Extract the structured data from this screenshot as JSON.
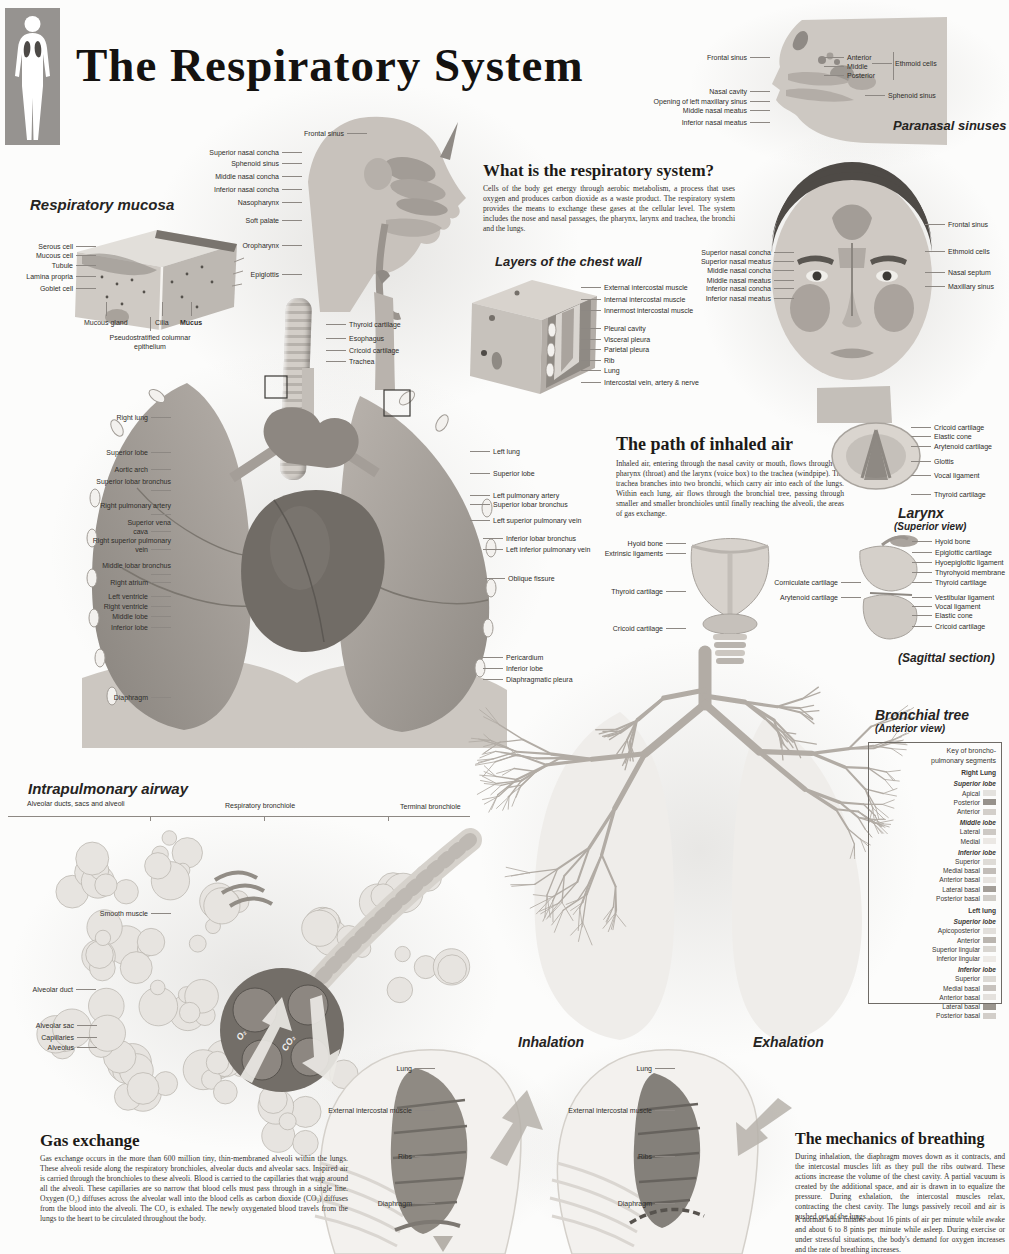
{
  "poster": {
    "title": "The Respiratory System"
  },
  "paranasal": {
    "title": "Paranasal sinuses",
    "labels_left": [
      "Frontal sinus",
      "Nasal cavity",
      "Opening of left maxillary sinus",
      "Middle nasal meatus",
      "Inferior nasal meatus"
    ],
    "ethmoid_items": [
      "Anterior",
      "Middle",
      "Posterior"
    ],
    "ethmoid_label": "Ethmoid cells",
    "sphenoid": "Sphenoid sinus"
  },
  "head_sagittal": {
    "labels": [
      "Frontal sinus",
      "Superior nasal concha",
      "Sphenoid sinus",
      "Middle nasal concha",
      "Inferior nasal concha",
      "Nasopharynx",
      "Soft palate",
      "Oropharynx",
      "Epiglottis"
    ],
    "trachea_labels": [
      "Thyroid cartilage",
      "Esophagus",
      "Cricoid cartilage",
      "Trachea"
    ]
  },
  "mucosa": {
    "title": "Respiratory mucosa",
    "labels_left": [
      "Serous cell",
      "Mucous cell",
      "Tubule",
      "Lamina propria",
      "Goblet cell"
    ],
    "labels_bottom": [
      "Mucous gland",
      "Cilia",
      "Mucus"
    ],
    "label_epithelium": "Pseudostratified columnar epithelium"
  },
  "what_is": {
    "heading": "What is the respiratory system?",
    "body": "Cells of the body get energy through aerobic metabolism, a process that uses oxygen and produces carbon dioxide as a waste product. The respiratory system provides the means to exchange these gases at the cellular level. The system includes the nose and nasal passages, the pharynx, larynx and trachea, the bronchi and the lungs."
  },
  "chest_wall": {
    "title": "Layers of the chest wall",
    "labels": [
      "External intercostal muscle",
      "Internal intercostal muscle",
      "Innermost intercostal muscle",
      "Pleural cavity",
      "Visceral pleura",
      "Parietal pleura",
      "Rib",
      "Lung",
      "Intercostal vein, artery & nerve"
    ]
  },
  "face": {
    "labels_left": [
      "Superior nasal concha",
      "Superior nasal meatus",
      "Middle nasal concha",
      "Middle nasal meatus",
      "Inferior nasal concha",
      "Inferior nasal meatus"
    ],
    "labels_right": [
      "Frontal sinus",
      "Ethmoid cells",
      "Nasal septum",
      "Maxillary sinus"
    ]
  },
  "lungs": {
    "labels_left": [
      "Right lung",
      "Superior lobe",
      "Aortic arch",
      "Superior lobar bronchus",
      "Right pulmonary artery",
      "Superior vena cava",
      "Right superior pulmonary vein",
      "Middle lobar bronchus",
      "Right atrium",
      "Left ventricle",
      "Right ventricle",
      "Middle lobe",
      "Inferior lobe",
      "Diaphragm"
    ],
    "labels_right": [
      "Left lung",
      "Superior lobe",
      "Left pulmonary artery",
      "Superior lobar bronchus",
      "Left superior pulmonary vein",
      "Inferior lobar bronchus",
      "Left inferior pulmonary vein",
      "Oblique fissure",
      "Pericardium",
      "Inferior lobe",
      "Diaphragmatic pleura"
    ]
  },
  "path_air": {
    "heading": "The path of inhaled air",
    "body": "Inhaled air, entering through the nasal cavity or mouth, flows through the pharynx (throat) and the larynx (voice box) to the trachea (windpipe). The trachea branches into two bronchi, which carry air into each of the lungs. Within each lung, air flows through the bronchial tree, passing through smaller and smaller bronchioles until finally reaching the alveoli, the areas of gas exchange."
  },
  "larynx": {
    "superior_labels": [
      "Cricoid cartilage",
      "Elastic cone",
      "Arytenoid cartilage",
      "Glottis",
      "Vocal ligament",
      "Thyroid cartilage"
    ],
    "superior_title": "Larynx",
    "superior_subtitle": "(Superior view)",
    "anterior_labels": [
      "Hyoid bone",
      "Extrinsic ligaments",
      "Thyroid cartilage",
      "Cricoid cartilage"
    ],
    "mid_labels": [
      "Corniculate cartilage",
      "Arytenoid cartilage"
    ],
    "sagittal_labels": [
      "Hyoid bone",
      "Epiglottic cartilage",
      "Hyoepiglottic ligament",
      "Thyrohyoid membrane",
      "Thyroid cartilage",
      "Vestibular ligament",
      "Vocal ligament",
      "Elastic cone",
      "Cricoid cartilage"
    ],
    "sagittal_caption": "(Sagittal section)"
  },
  "bronchial": {
    "title": "Bronchial tree",
    "subtitle": "(Anterior view)",
    "key": {
      "items": [
        {
          "label": "Key of broncho-",
          "style": "head"
        },
        {
          "label": "pulmonary segments",
          "style": "head"
        },
        {
          "label": "Right Lung",
          "style": "lung"
        },
        {
          "label": "Superior lobe",
          "style": "lobe"
        },
        {
          "label": "Apical",
          "style": "seg",
          "color": "#e4e2de"
        },
        {
          "label": "Posterior",
          "style": "seg",
          "color": "#97928c"
        },
        {
          "label": "Anterior",
          "style": "seg",
          "color": "#d3cfca"
        },
        {
          "label": "Middle lobe",
          "style": "lobe"
        },
        {
          "label": "Lateral",
          "style": "seg",
          "color": "#cdc9c4"
        },
        {
          "label": "Medial",
          "style": "seg",
          "color": "#ebe8e4"
        },
        {
          "label": "Inferior lobe",
          "style": "lobe"
        },
        {
          "label": "Superior",
          "style": "seg",
          "color": "#dedbd6"
        },
        {
          "label": "Medial basal",
          "style": "seg",
          "color": "#c2bdb8"
        },
        {
          "label": "Anterior basal",
          "style": "seg",
          "color": "#e6e3df"
        },
        {
          "label": "Lateral basal",
          "style": "seg",
          "color": "#a39e98"
        },
        {
          "label": "Posterior basal",
          "style": "seg",
          "color": "#cfccc7"
        },
        {
          "label": "Left lung",
          "style": "lung"
        },
        {
          "label": "Superior lobe",
          "style": "lobe"
        },
        {
          "label": "Apicoposterior",
          "style": "seg",
          "color": "#e2dfdb"
        },
        {
          "label": "Anterior",
          "style": "seg",
          "color": "#bab5af"
        },
        {
          "label": "Superior lingular",
          "style": "seg",
          "color": "#d8d5d0"
        },
        {
          "label": "Inferior lingular",
          "style": "seg",
          "color": "#edeae6"
        },
        {
          "label": "Inferior lobe",
          "style": "lobe"
        },
        {
          "label": "Superior",
          "style": "seg",
          "color": "#dcd9d4"
        },
        {
          "label": "Medial basal",
          "style": "seg",
          "color": "#c7c2bd"
        },
        {
          "label": "Anterior basal",
          "style": "seg",
          "color": "#e4e1dd"
        },
        {
          "label": "Lateral basal",
          "style": "seg",
          "color": "#9b968f"
        },
        {
          "label": "Posterior basal",
          "style": "seg",
          "color": "#d2cec9"
        }
      ]
    }
  },
  "intrapulmonary": {
    "title": "Intrapulmonary airway",
    "scale_labels": [
      "Alveolar ducts, sacs and alveoli",
      "Respiratory bronchiole",
      "Terminal bronchiole"
    ],
    "labels": [
      "Smooth muscle",
      "Alveolar duct",
      "Alveolar sac",
      "Capillaries",
      "Alveolus"
    ],
    "o2": "O₂",
    "co2": "CO₂"
  },
  "gas_exchange": {
    "heading": "Gas exchange",
    "body": "Gas exchange occurs in the more than 600 million tiny, thin-membraned alveoli within the lungs. These alveoli reside along the respiratory bronchioles, alveolar ducts and alveolar sacs. Inspired air is carried through the bronchioles to these alveoli. Blood is carried to the capillaries that wrap around all the alveoli. These capillaries are so narrow that blood cells must pass through in a single line. Oxygen (O₂) diffuses across the alveolar wall into the blood cells as carbon dioxide (CO₂) diffuses from the blood into the alveoli. The CO₂ is exhaled. The newly oxygenated blood travels from the lungs to the heart to be circulated throughout the body."
  },
  "breathing": {
    "inhalation_title": "Inhalation",
    "exhalation_title": "Exhalation",
    "figure_labels": [
      "Lung",
      "External intercostal muscle",
      "Ribs",
      "Diaphragm"
    ]
  },
  "mechanics": {
    "heading": "The mechanics of breathing",
    "body1": "During inhalation, the diaphragm moves down as it contracts, and the intercostal muscles lift as they pull the ribs outward. These actions increase the volume of the chest cavity. A partial vacuum is created by the additional space, and air is drawn in to equalize the pressure. During exhalation, the intercostal muscles relax, contracting the chest cavity. The lungs passively recoil and air is pushed out of the lungs.",
    "body2": "A normal adult inhales about 16 pints of air per minute while awake and about 6 to 8 pints per minute while asleep. During exercise or under stressful situations, the body's demand for oxygen increases and the rate of breathing increases."
  }
}
